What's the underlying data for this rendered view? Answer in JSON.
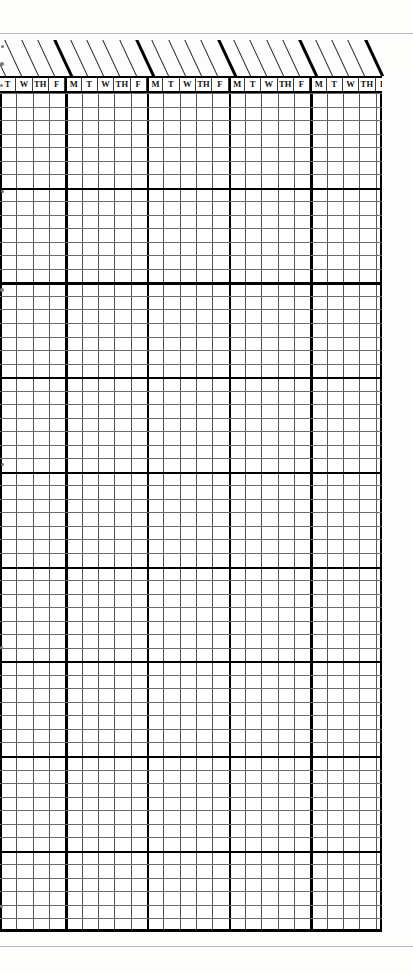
{
  "document": {
    "type": "scanned-timesheet-grid",
    "title": "Weekly day-column grid form",
    "background_color": "#fdfdfc",
    "ink_color": "#000000"
  },
  "grid": {
    "column_headers": [
      "T",
      "W",
      "TH",
      "F",
      "M",
      "T",
      "W",
      "TH",
      "F",
      "M",
      "T",
      "W",
      "TH",
      "F",
      "M",
      "T",
      "W",
      "TH",
      "F",
      "M",
      "T",
      "W",
      "TH",
      "F"
    ],
    "week_start_indices": [
      4,
      9,
      14,
      19
    ],
    "column_count": 24,
    "column_width_px": 16.33,
    "row_count": 62,
    "row_height_px": 13.53,
    "major_row_every": 7,
    "left_px": 0,
    "top_px": 93,
    "width_px": 382,
    "height_px": 839
  },
  "header_band": {
    "diagonal_mark_count": 24,
    "heavy_diagonal_indices": [
      4,
      9,
      14,
      19,
      23
    ],
    "angle_deg": -25
  },
  "rules": {
    "top_rule_y": 33,
    "bottom_rule_y": 946,
    "rule_color": "#b9b9b9"
  },
  "specks": [
    {
      "x": 1,
      "y": 45,
      "d": 3
    },
    {
      "x": 0,
      "y": 62,
      "d": 4
    },
    {
      "x": 0,
      "y": 84,
      "d": 3
    },
    {
      "x": 1,
      "y": 190,
      "d": 3
    },
    {
      "x": 0,
      "y": 288,
      "d": 4
    },
    {
      "x": 1,
      "y": 463,
      "d": 3
    },
    {
      "x": 0,
      "y": 646,
      "d": 3
    },
    {
      "x": 0,
      "y": 905,
      "d": 3
    }
  ]
}
